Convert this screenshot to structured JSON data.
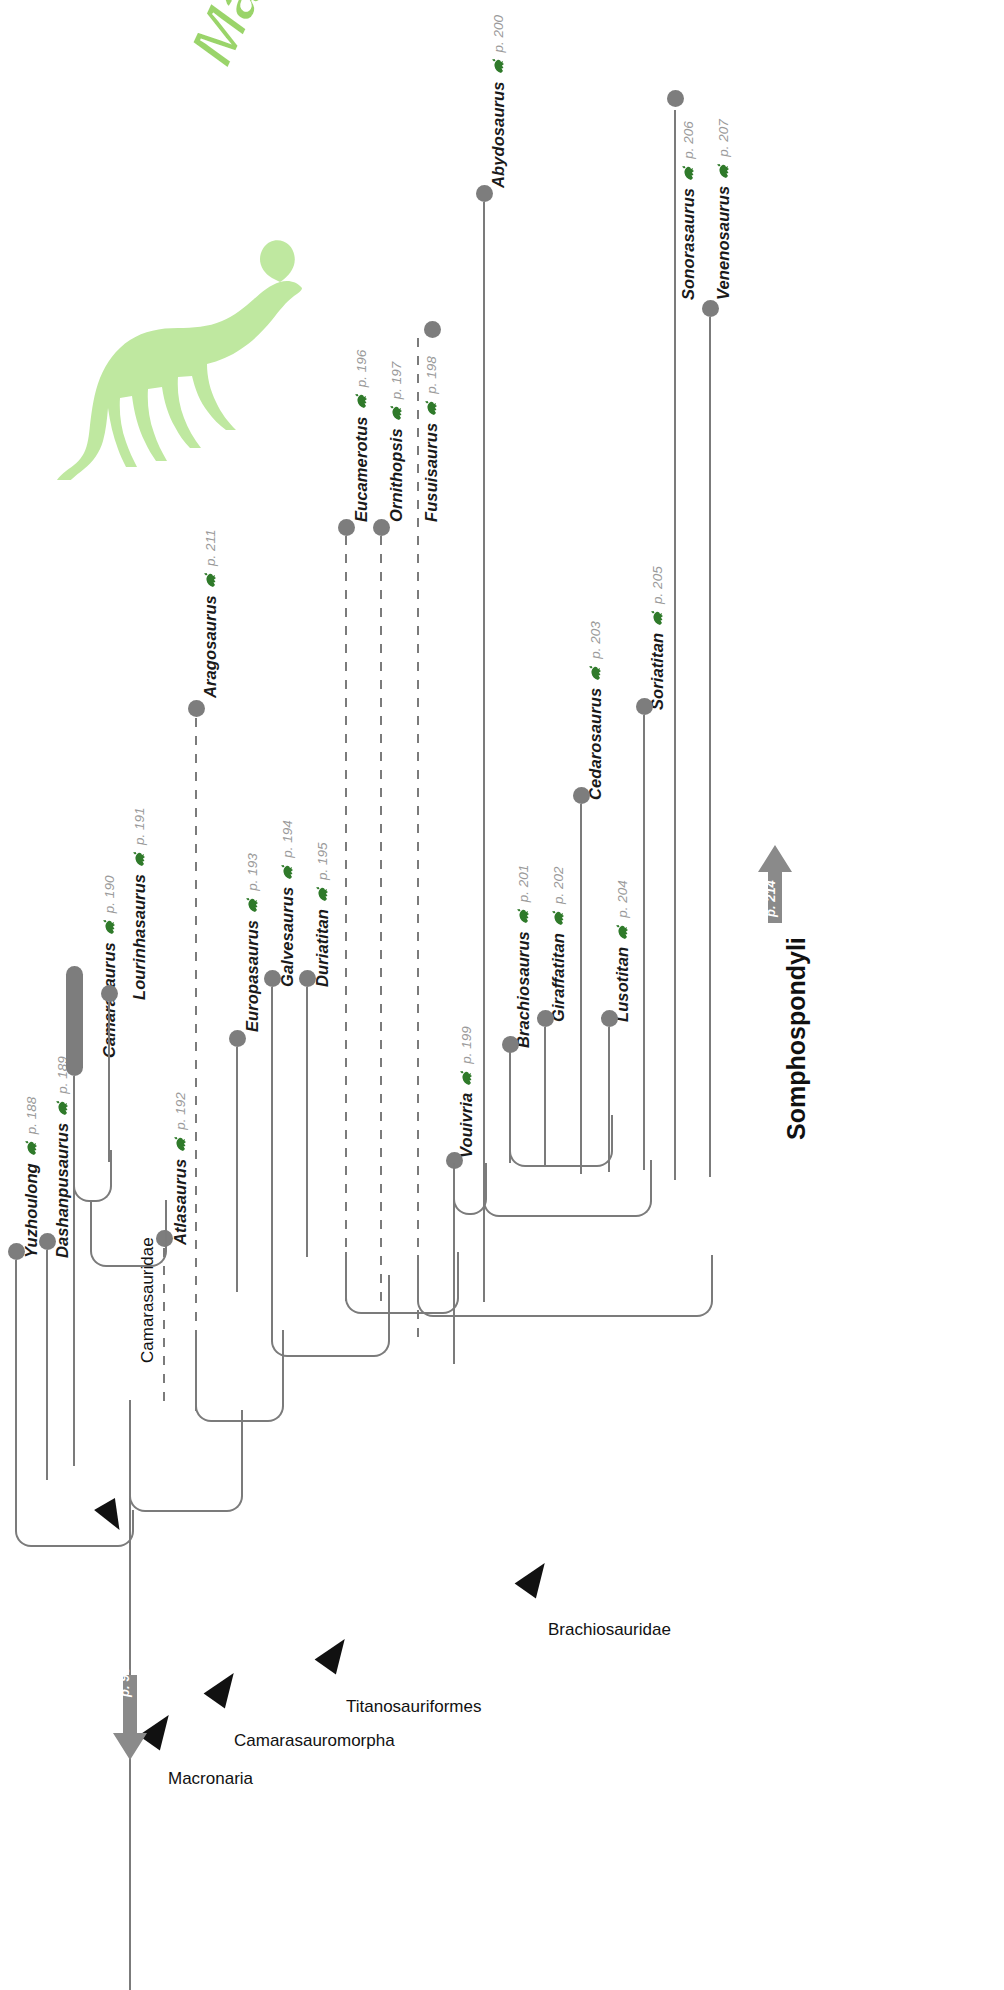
{
  "figure": {
    "title": "Macronaria",
    "type": "cladogram",
    "title_color": "#9ad46a",
    "node_color": "#7d7d7d",
    "branch_color": "#7b7b7b",
    "pageref_color": "#9a9a9a"
  },
  "taxa": [
    {
      "name": "Yuzhoulong",
      "page": "p. 188",
      "icon": "dinosaur-icon"
    },
    {
      "name": "Dashanpusaurus",
      "page": "p. 189",
      "icon": "dinosaur-icon"
    },
    {
      "name": "Camarasaurus",
      "page": "p. 190",
      "icon": "dinosaur-icon"
    },
    {
      "name": "Lourinhasaurus",
      "page": "p. 191",
      "icon": "dinosaur-icon"
    },
    {
      "name": "Atlasaurus",
      "page": "p. 192",
      "icon": "dinosaur-icon"
    },
    {
      "name": "Europasaurus",
      "page": "p. 193",
      "icon": "dinosaur-icon"
    },
    {
      "name": "Galvesaurus",
      "page": "p. 194",
      "icon": "dinosaur-icon"
    },
    {
      "name": "Duriatitan",
      "page": "p. 195",
      "icon": "dinosaur-icon"
    },
    {
      "name": "Eucamerotus",
      "page": "p. 196",
      "icon": "dinosaur-icon"
    },
    {
      "name": "Ornithopsis",
      "page": "p. 197",
      "icon": "dinosaur-icon"
    },
    {
      "name": "Fusuisaurus",
      "page": "p. 198",
      "icon": "dinosaur-icon"
    },
    {
      "name": "Vouivria",
      "page": "p. 199",
      "icon": "dinosaur-icon"
    },
    {
      "name": "Abydosaurus",
      "page": "p. 200",
      "icon": "dinosaur-icon"
    },
    {
      "name": "Brachiosaurus",
      "page": "p. 201",
      "icon": "dinosaur-icon"
    },
    {
      "name": "Giraffatitan",
      "page": "p. 202",
      "icon": "dinosaur-icon"
    },
    {
      "name": "Cedarosaurus",
      "page": "p. 203",
      "icon": "dinosaur-icon"
    },
    {
      "name": "Lusotitan",
      "page": "p. 204",
      "icon": "dinosaur-icon"
    },
    {
      "name": "Soriatitan",
      "page": "p. 205",
      "icon": "dinosaur-icon"
    },
    {
      "name": "Sonorasaurus",
      "page": "p. 206",
      "icon": "dinosaur-icon"
    },
    {
      "name": "Venenosaurus",
      "page": "p. 207",
      "icon": "dinosaur-icon"
    },
    {
      "name": "Aragosaurus",
      "page": "p. 211",
      "icon": "dinosaur-icon"
    }
  ],
  "clades": [
    {
      "name": "Camarasauridae",
      "style": "vertical"
    },
    {
      "name": "Brachiosauridae",
      "style": "horizontal"
    },
    {
      "name": "Titanosauriformes",
      "style": "horizontal"
    },
    {
      "name": "Camarasauromorpha",
      "style": "horizontal"
    },
    {
      "name": "Macronaria",
      "style": "horizontal"
    },
    {
      "name": "Somphospondyli",
      "style": "vertical-bold",
      "page": "p. 214"
    }
  ],
  "root": {
    "page": "p. 96"
  }
}
